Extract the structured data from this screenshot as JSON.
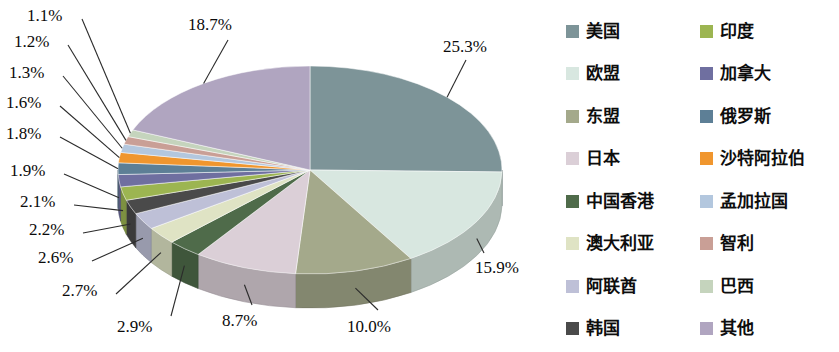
{
  "chart_data": {
    "type": "pie",
    "title": "",
    "subtitle": "",
    "xlabel": "",
    "ylabel": "",
    "legend_position": "right",
    "grid": false,
    "three_d": true,
    "units": "percent",
    "categories": [
      "美国",
      "欧盟",
      "东盟",
      "日本",
      "中国香港",
      "澳大利亚",
      "阿联酋",
      "韩国",
      "印度",
      "加拿大",
      "俄罗斯",
      "沙特阿拉伯",
      "孟加拉国",
      "智利",
      "巴西",
      "其他"
    ],
    "values": [
      25.3,
      15.9,
      10.0,
      8.7,
      2.9,
      2.7,
      2.6,
      2.2,
      2.1,
      1.9,
      1.8,
      1.6,
      1.3,
      1.2,
      1.1,
      18.7
    ],
    "value_labels": [
      "25.3%",
      "15.9%",
      "10.0%",
      "8.7%",
      "2.9%",
      "2.7%",
      "2.6%",
      "2.2%",
      "2.1%",
      "1.9%",
      "1.8%",
      "1.6%",
      "1.3%",
      "1.2%",
      "1.1%",
      "18.7%"
    ],
    "colors": [
      "#7d9498",
      "#d8e7e0",
      "#a4a98b",
      "#dbcfd7",
      "#4f6b4a",
      "#dfe3c4",
      "#bec0d7",
      "#4a4a4a",
      "#9cb551",
      "#6f6fa0",
      "#5d7f96",
      "#f0962e",
      "#b3c7de",
      "#c99f96",
      "#c5d4bd",
      "#b0a5c0"
    ],
    "slices": [
      {
        "label": "美国",
        "value": 25.3,
        "value_label": "25.3%",
        "color": "#7d9498"
      },
      {
        "label": "欧盟",
        "value": 15.9,
        "value_label": "15.9%",
        "color": "#d8e7e0"
      },
      {
        "label": "东盟",
        "value": 10.0,
        "value_label": "10.0%",
        "color": "#a4a98b"
      },
      {
        "label": "日本",
        "value": 8.7,
        "value_label": "8.7%",
        "color": "#dbcfd7"
      },
      {
        "label": "中国香港",
        "value": 2.9,
        "value_label": "2.9%",
        "color": "#4f6b4a"
      },
      {
        "label": "澳大利亚",
        "value": 2.7,
        "value_label": "2.7%",
        "color": "#dfe3c4"
      },
      {
        "label": "阿联酋",
        "value": 2.6,
        "value_label": "2.6%",
        "color": "#bec0d7"
      },
      {
        "label": "韩国",
        "value": 2.2,
        "value_label": "2.2%",
        "color": "#4a4a4a"
      },
      {
        "label": "印度",
        "value": 2.1,
        "value_label": "2.1%",
        "color": "#9cb551"
      },
      {
        "label": "加拿大",
        "value": 1.9,
        "value_label": "1.9%",
        "color": "#6f6fa0"
      },
      {
        "label": "俄罗斯",
        "value": 1.8,
        "value_label": "1.8%",
        "color": "#5d7f96"
      },
      {
        "label": "沙特阿拉伯",
        "value": 1.6,
        "value_label": "1.6%",
        "color": "#f0962e"
      },
      {
        "label": "孟加拉国",
        "value": 1.3,
        "value_label": "1.3%",
        "color": "#b3c7de"
      },
      {
        "label": "智利",
        "value": 1.2,
        "value_label": "1.2%",
        "color": "#c99f96"
      },
      {
        "label": "巴西",
        "value": 1.1,
        "value_label": "1.1%",
        "color": "#c5d4bd"
      },
      {
        "label": "其他",
        "value": 18.7,
        "value_label": "18.7%",
        "color": "#b0a5c0"
      }
    ]
  },
  "labels": {
    "p_25_3": "25.3%",
    "p_18_7": "18.7%",
    "p_15_9": "15.9%",
    "p_10_0": "10.0%",
    "p_8_7": "8.7%",
    "p_2_9": "2.9%",
    "p_2_7": "2.7%",
    "p_2_6": "2.6%",
    "p_2_2": "2.2%",
    "p_2_1": "2.1%",
    "p_1_9": "1.9%",
    "p_1_8": "1.8%",
    "p_1_6": "1.6%",
    "p_1_3": "1.3%",
    "p_1_2": "1.2%",
    "p_1_1": "1.1%"
  },
  "legend": {
    "items": [
      {
        "label": "美国",
        "color": "#7d9498"
      },
      {
        "label": "欧盟",
        "color": "#d8e7e0"
      },
      {
        "label": "东盟",
        "color": "#a4a98b"
      },
      {
        "label": "日本",
        "color": "#dbcfd7"
      },
      {
        "label": "中国香港",
        "color": "#4f6b4a"
      },
      {
        "label": "澳大利亚",
        "color": "#dfe3c4"
      },
      {
        "label": "阿联酋",
        "color": "#bec0d7"
      },
      {
        "label": "韩国",
        "color": "#4a4a4a"
      },
      {
        "label": "印度",
        "color": "#9cb551"
      },
      {
        "label": "加拿大",
        "color": "#6f6fa0"
      },
      {
        "label": "俄罗斯",
        "color": "#5d7f96"
      },
      {
        "label": "沙特阿拉伯",
        "color": "#f0962e"
      },
      {
        "label": "孟加拉国",
        "color": "#b3c7de"
      },
      {
        "label": "智利",
        "color": "#c99f96"
      },
      {
        "label": "巴西",
        "color": "#c5d4bd"
      },
      {
        "label": "其他",
        "color": "#b0a5c0"
      }
    ]
  }
}
